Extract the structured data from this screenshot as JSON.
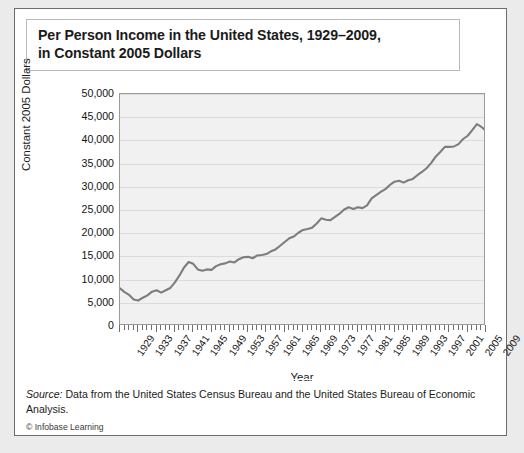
{
  "title": {
    "line1": "Per Person Income in the United States, 1929–2009,",
    "line2": "in Constant 2005 Dollars"
  },
  "source": {
    "label": "Source:",
    "text": " Data from the United States Census Bureau and the United States Bureau of Economic Analysis.",
    "copyright": "© Infobase Learning"
  },
  "colors": {
    "line": "#7d7d7d",
    "plot_background": "#f1f1f1",
    "gridline": "#dcdcdc",
    "axis": "#9a9a9a",
    "page_background": "#ebebeb",
    "card_background": "#ffffff",
    "text": "#1b1b1b"
  },
  "chart_data": {
    "type": "line",
    "title": "Per Person Income in the United States, 1929–2009, in Constant 2005 Dollars",
    "xlabel": "Year",
    "ylabel": "Constant 2005 Dollars",
    "xlim": [
      1929,
      2009
    ],
    "ylim": [
      0,
      50000
    ],
    "grid": true,
    "legend": "none",
    "ytick_labels": [
      "50,000",
      "45,000",
      "40,000",
      "35,000",
      "30,000",
      "25,000",
      "20,000",
      "15,000",
      "10,000",
      "5,000",
      "0"
    ],
    "ytick_values": [
      50000,
      45000,
      40000,
      35000,
      30000,
      25000,
      20000,
      15000,
      10000,
      5000,
      0
    ],
    "xtick_labels": [
      "1929",
      "1933",
      "1937",
      "1941",
      "1945",
      "1949",
      "1953",
      "1957",
      "1961",
      "1965",
      "1969",
      "1973",
      "1977",
      "1981",
      "1985",
      "1989",
      "1993",
      "1997",
      "2001",
      "2005",
      "2009"
    ],
    "xtick_values": [
      1929,
      1933,
      1937,
      1941,
      1945,
      1949,
      1953,
      1957,
      1961,
      1965,
      1969,
      1973,
      1977,
      1981,
      1985,
      1989,
      1993,
      1997,
      2001,
      2005,
      2009
    ],
    "minor_tick_interval": 1,
    "x": [
      1929,
      1930,
      1931,
      1932,
      1933,
      1934,
      1935,
      1936,
      1937,
      1938,
      1939,
      1940,
      1941,
      1942,
      1943,
      1944,
      1945,
      1946,
      1947,
      1948,
      1949,
      1950,
      1951,
      1952,
      1953,
      1954,
      1955,
      1956,
      1957,
      1958,
      1959,
      1960,
      1961,
      1962,
      1963,
      1964,
      1965,
      1966,
      1967,
      1968,
      1969,
      1970,
      1971,
      1972,
      1973,
      1974,
      1975,
      1976,
      1977,
      1978,
      1979,
      1980,
      1981,
      1982,
      1983,
      1984,
      1985,
      1986,
      1987,
      1988,
      1989,
      1990,
      1991,
      1992,
      1993,
      1994,
      1995,
      1996,
      1997,
      1998,
      1999,
      2000,
      2001,
      2002,
      2003,
      2004,
      2005,
      2006,
      2007,
      2008,
      2009
    ],
    "values": [
      8100,
      7300,
      6700,
      5700,
      5500,
      6100,
      6600,
      7400,
      7700,
      7200,
      7700,
      8200,
      9400,
      10900,
      12600,
      13800,
      13400,
      12200,
      11900,
      12200,
      12100,
      12900,
      13300,
      13500,
      13900,
      13700,
      14400,
      14800,
      14900,
      14600,
      15200,
      15300,
      15500,
      16100,
      16500,
      17300,
      18100,
      18900,
      19300,
      20100,
      20700,
      20900,
      21200,
      22100,
      23200,
      22900,
      22800,
      23500,
      24200,
      25100,
      25600,
      25200,
      25600,
      25400,
      26000,
      27500,
      28200,
      28900,
      29500,
      30400,
      31100,
      31300,
      30900,
      31400,
      31700,
      32500,
      33200,
      34000,
      35100,
      36500,
      37500,
      38600,
      38600,
      38700,
      39200,
      40300,
      41000,
      42200,
      43500,
      42900,
      42100
    ],
    "annotations": []
  }
}
